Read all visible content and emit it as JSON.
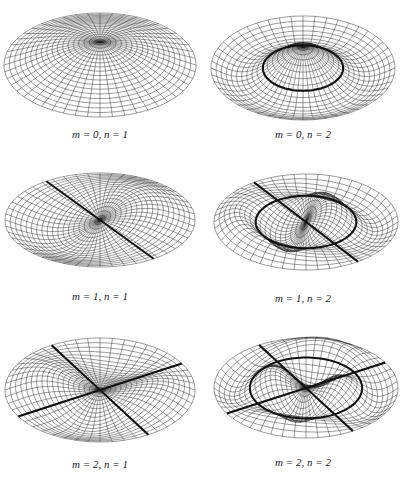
{
  "figure": {
    "panels": [
      {
        "id": "p01",
        "m": 0,
        "n": 1,
        "caption": "m = 0, n = 1",
        "nodal_circles": 0,
        "nodal_diameters": 0
      },
      {
        "id": "p02",
        "m": 0,
        "n": 2,
        "caption": "m = 0, n = 2",
        "nodal_circles": 1,
        "nodal_diameters": 0
      },
      {
        "id": "p11",
        "m": 1,
        "n": 1,
        "caption": "m = 1, n = 1",
        "nodal_circles": 0,
        "nodal_diameters": 1
      },
      {
        "id": "p12",
        "m": 1,
        "n": 2,
        "caption": "m = 1, n = 2",
        "nodal_circles": 1,
        "nodal_diameters": 1
      },
      {
        "id": "p21",
        "m": 2,
        "n": 1,
        "caption": "m = 2, n = 1",
        "nodal_circles": 0,
        "nodal_diameters": 2
      },
      {
        "id": "p22",
        "m": 2,
        "n": 2,
        "caption": "m = 2, n = 2",
        "nodal_circles": 1,
        "nodal_diameters": 2
      }
    ],
    "colors": {
      "mesh": "#222222",
      "nodal_line": "#111111",
      "background": "#ffffff"
    }
  }
}
